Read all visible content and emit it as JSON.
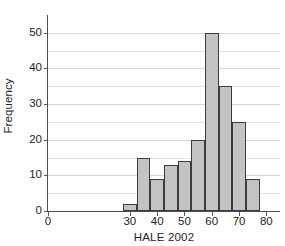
{
  "chart_data": {
    "type": "bar",
    "title": "",
    "subtitle": "",
    "xlabel": "HALE 2002",
    "ylabel": "Frequency",
    "xlim": [
      0,
      85
    ],
    "ylim": [
      0,
      55
    ],
    "grid": true,
    "legend": null,
    "bin_width": 5,
    "bin_edges": [
      27.5,
      32.5,
      37.5,
      42.5,
      47.5,
      52.5,
      57.5,
      62.5,
      67.5,
      72.5,
      77.5
    ],
    "categories": [
      "27.5-32.5",
      "32.5-37.5",
      "37.5-42.5",
      "42.5-47.5",
      "47.5-52.5",
      "52.5-57.5",
      "57.5-62.5",
      "62.5-67.5",
      "67.5-72.5",
      "72.5-77.5"
    ],
    "values": [
      2,
      15,
      9,
      13,
      14,
      20,
      50,
      35,
      25,
      9
    ],
    "xticks": [
      0,
      30,
      40,
      50,
      60,
      70,
      80
    ],
    "xtick_labels": [
      "0",
      "30",
      "40",
      "50",
      "60",
      "70",
      "80"
    ],
    "yticks": [
      0,
      10,
      20,
      30,
      40,
      50
    ],
    "ytick_labels": [
      "0",
      "10",
      "20",
      "30",
      "40",
      "50"
    ],
    "y_minor_ticks": [
      5,
      15,
      25,
      35,
      45
    ],
    "bar_fill_color": "#c3c3c3",
    "bar_edge_color": "#3c3c3c",
    "grid_color": "#e3e3e3",
    "axis_color": "#4d4d4f",
    "text_color": "#231f20",
    "background_color": "#ffffff"
  }
}
